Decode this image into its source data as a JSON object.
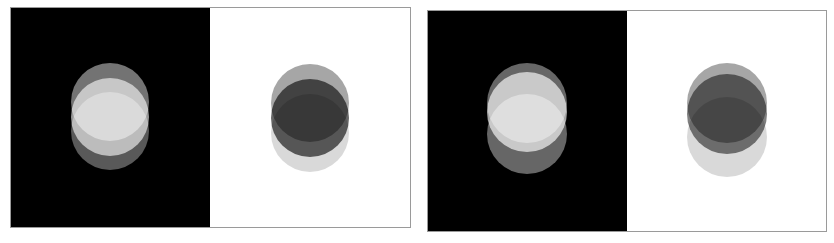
{
  "figures": [
    {
      "id": "figure-a",
      "x": 10,
      "y": 7,
      "width": 401,
      "height": 221,
      "panels": [
        {
          "background": "#000000",
          "width": 200,
          "circles": [
            {
              "cx": 100,
              "cy": 95,
              "r": 39,
              "fill": "#ffffff",
              "opacity": 0.45
            },
            {
              "cx": 100,
              "cy": 110,
              "r": 39,
              "fill": "#ffffff",
              "opacity": 0.6
            },
            {
              "cx": 100,
              "cy": 124,
              "r": 39,
              "fill": "#ffffff",
              "opacity": 0.35
            }
          ]
        },
        {
          "background": "#ffffff",
          "width": 201,
          "circles": [
            {
              "cx": 100,
              "cy": 96,
              "r": 39,
              "fill": "#000000",
              "opacity": 0.35
            },
            {
              "cx": 100,
              "cy": 111,
              "r": 39,
              "fill": "#000000",
              "opacity": 0.6
            },
            {
              "cx": 100,
              "cy": 126,
              "r": 39,
              "fill": "#000000",
              "opacity": 0.15
            }
          ]
        }
      ]
    },
    {
      "id": "figure-b",
      "x": 427,
      "y": 10,
      "width": 400,
      "height": 222,
      "panels": [
        {
          "background": "#000000",
          "width": 200,
          "circles": [
            {
              "cx": 100,
              "cy": 93,
              "r": 40,
              "fill": "#ffffff",
              "opacity": 0.4
            },
            {
              "cx": 100,
              "cy": 102,
              "r": 40,
              "fill": "#ffffff",
              "opacity": 0.65
            },
            {
              "cx": 100,
              "cy": 124,
              "r": 40,
              "fill": "#ffffff",
              "opacity": 0.4
            }
          ]
        },
        {
          "background": "#ffffff",
          "width": 200,
          "circles": [
            {
              "cx": 100,
              "cy": 93,
              "r": 40,
              "fill": "#000000",
              "opacity": 0.35
            },
            {
              "cx": 100,
              "cy": 104,
              "r": 40,
              "fill": "#000000",
              "opacity": 0.5
            },
            {
              "cx": 100,
              "cy": 127,
              "r": 40,
              "fill": "#000000",
              "opacity": 0.15
            }
          ]
        }
      ]
    }
  ],
  "border_color": "#9a9a9a"
}
